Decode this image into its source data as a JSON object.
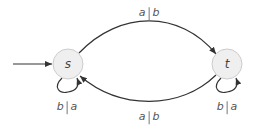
{
  "diagram": {
    "type": "state-machine",
    "colors": {
      "edge": "#333333",
      "node_fill": "#efefef",
      "node_stroke": "#cccccc",
      "text": "#555555"
    },
    "nodes": [
      {
        "id": "s",
        "label": "s",
        "initial": true
      },
      {
        "id": "t",
        "label": "t",
        "initial": false
      }
    ],
    "edges": [
      {
        "from": "s",
        "to": "t",
        "input": "a",
        "output": "b"
      },
      {
        "from": "t",
        "to": "s",
        "input": "a",
        "output": "b"
      },
      {
        "from": "s",
        "to": "s",
        "input": "b",
        "output": "a"
      },
      {
        "from": "t",
        "to": "t",
        "input": "b",
        "output": "a"
      }
    ]
  }
}
